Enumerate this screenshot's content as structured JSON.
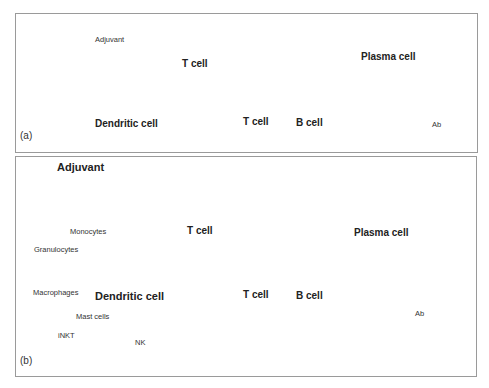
{
  "panel_a": {
    "tag": "(a)",
    "adjuvant": "Adjuvant",
    "dendritic_cell": "Dendritic cell",
    "t_cell_1": "T cell",
    "t_cell_2": "T cell",
    "b_cell": "B cell",
    "plasma_cell": "Plasma cell",
    "antibody": "Ab"
  },
  "panel_b": {
    "tag": "(b)",
    "adjuvant": "Adjuvant",
    "innate_cells": [
      "Monocytes",
      "Granulocytes",
      "Macrophages",
      "Mast cells",
      "iNKT",
      "NK"
    ],
    "dendritic_cell": "Dendritic cell",
    "t_cell_1": "T cell",
    "t_cell_2": "T cell",
    "b_cell": "B cell",
    "plasma_cell": "Plasma cell",
    "antibody": "Ab"
  },
  "colors": {
    "border": "#9a9a9a",
    "dendritic_fill": "#e8eaea",
    "t_cell_dark": "#3a3a3a",
    "t_cell_light": "#bcbcbc",
    "b_cell": "#5c5c5c",
    "plasma_cell": "#c8c8c8",
    "arrow": "#111111"
  }
}
